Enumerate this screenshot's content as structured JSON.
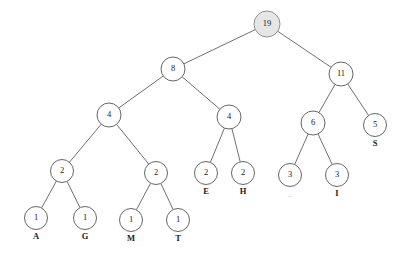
{
  "figure": {
    "type": "huffman-tree",
    "title": "",
    "background_color": "#ffffff",
    "line_color": "#4a4a4a",
    "node_fill": "#ffffff",
    "root_fill": "#e6e6e6",
    "text_color": "#1a1a1a"
  },
  "chart_data": {
    "type": "diagram",
    "title": "",
    "xlabel": "",
    "ylabel": "",
    "nodes": [
      {
        "id": "n19",
        "label": "19",
        "symbol": "",
        "x": 267,
        "y": 24,
        "r": 13,
        "level": 0,
        "highlight": true
      },
      {
        "id": "n8",
        "label": "8",
        "symbol": "",
        "x": 173,
        "y": 69,
        "r": 12,
        "level": 1,
        "highlight": false
      },
      {
        "id": "n11",
        "label": "11",
        "symbol": "",
        "x": 341,
        "y": 74,
        "r": 12,
        "level": 1,
        "highlight": false
      },
      {
        "id": "n4a",
        "label": "4",
        "symbol": "",
        "x": 109,
        "y": 115,
        "r": 12,
        "level": 2,
        "highlight": false
      },
      {
        "id": "n4b",
        "label": "4",
        "symbol": "",
        "x": 229,
        "y": 117,
        "r": 12,
        "level": 2,
        "highlight": false
      },
      {
        "id": "n6",
        "label": "6",
        "symbol": "",
        "x": 313,
        "y": 123,
        "r": 12,
        "level": 2,
        "highlight": false
      },
      {
        "id": "n5",
        "label": "5",
        "symbol": "S",
        "x": 375,
        "y": 125,
        "r": 11.5,
        "level": 2,
        "highlight": false
      },
      {
        "id": "n2a",
        "label": "2",
        "symbol": "",
        "x": 62,
        "y": 171,
        "r": 11.5,
        "level": 3,
        "highlight": false
      },
      {
        "id": "n2b",
        "label": "2",
        "symbol": "",
        "x": 156,
        "y": 173,
        "r": 11.5,
        "level": 3,
        "highlight": false
      },
      {
        "id": "n2c",
        "label": "2",
        "symbol": "E",
        "x": 206,
        "y": 173,
        "r": 11.5,
        "level": 3,
        "highlight": false
      },
      {
        "id": "n2d",
        "label": "2",
        "symbol": "H",
        "x": 243,
        "y": 173,
        "r": 11.5,
        "level": 3,
        "highlight": false
      },
      {
        "id": "n3a",
        "label": "3",
        "symbol": "_",
        "x": 290,
        "y": 175,
        "r": 11.5,
        "level": 3,
        "highlight": false,
        "symbol_faint": true
      },
      {
        "id": "n3b",
        "label": "3",
        "symbol": "I",
        "x": 337,
        "y": 175,
        "r": 11.5,
        "level": 3,
        "highlight": false
      },
      {
        "id": "n1a",
        "label": "1",
        "symbol": "A",
        "x": 36,
        "y": 218,
        "r": 11.5,
        "level": 4,
        "highlight": false
      },
      {
        "id": "n1b",
        "label": "1",
        "symbol": "G",
        "x": 85,
        "y": 218,
        "r": 11.5,
        "level": 4,
        "highlight": false
      },
      {
        "id": "n1c",
        "label": "1",
        "symbol": "M",
        "x": 131,
        "y": 220,
        "r": 11.5,
        "level": 4,
        "highlight": false
      },
      {
        "id": "n1d",
        "label": "1",
        "symbol": "T",
        "x": 178,
        "y": 220,
        "r": 11.5,
        "level": 4,
        "highlight": false
      }
    ],
    "edges": [
      {
        "from": "n19",
        "to": "n8"
      },
      {
        "from": "n19",
        "to": "n11"
      },
      {
        "from": "n8",
        "to": "n4a"
      },
      {
        "from": "n8",
        "to": "n4b"
      },
      {
        "from": "n11",
        "to": "n6"
      },
      {
        "from": "n11",
        "to": "n5"
      },
      {
        "from": "n4a",
        "to": "n2a"
      },
      {
        "from": "n4a",
        "to": "n2b"
      },
      {
        "from": "n4b",
        "to": "n2c"
      },
      {
        "from": "n4b",
        "to": "n2d"
      },
      {
        "from": "n6",
        "to": "n3a"
      },
      {
        "from": "n6",
        "to": "n3b"
      },
      {
        "from": "n2a",
        "to": "n1a"
      },
      {
        "from": "n2a",
        "to": "n1b"
      },
      {
        "from": "n2b",
        "to": "n1c"
      },
      {
        "from": "n2b",
        "to": "n1d"
      }
    ],
    "leaf_symbols": [
      "A",
      "G",
      "M",
      "T",
      "E",
      "H",
      "_",
      "I",
      "S"
    ],
    "leaf_weights": [
      1,
      1,
      1,
      1,
      2,
      2,
      3,
      3,
      5
    ],
    "internal_weights": [
      19,
      8,
      11,
      4,
      4,
      6,
      2,
      2
    ]
  }
}
